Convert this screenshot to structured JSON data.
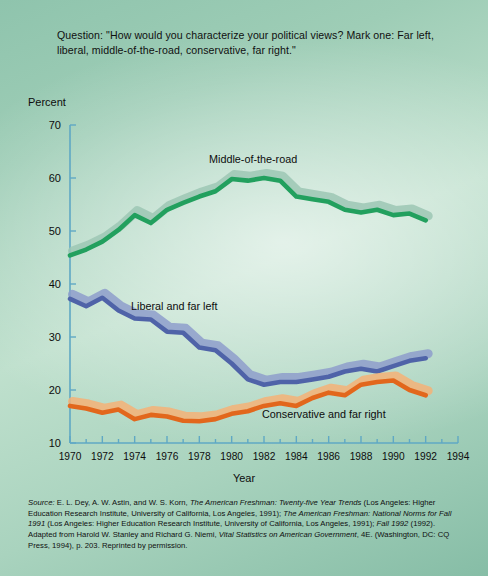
{
  "question": "Question: \"How would you characterize your political views? Mark one: Far left, liberal, middle-of-the-road, conservative, far right.\"",
  "axis": {
    "y_title": "Percent",
    "x_title": "Year"
  },
  "source_note": {
    "label": "Source:",
    "text_1": " E. L. Dey, A. W. Astin, and W. S. Korn, ",
    "italic_1": "The American Freshman: Twenty-five Year Trends",
    "text_2": " (Los Angeles: Higher Education Research Institute, University of California, Los Angeles, 1991); ",
    "italic_2": "The American Freshman: National Norms for Fall 1991",
    "text_3": " (Los Angeles: Higher Education Research Institute, University of California, Los Angeles, 1991); ",
    "italic_3": "Fall 1992",
    "text_4": " (1992). Adapted from Harold W. Stanley and Richard G. Niemi, ",
    "italic_4": "Vital Statistics on American Government",
    "text_5": ", 4E. (Washington, DC: CQ Press, 1994), p. 203. Reprinted by permission."
  },
  "colors": {
    "background_top": "#8fc4ad",
    "background_mid": "#bfe0cd",
    "axis": "#5fa8c4",
    "middle_of_road": "#22a05e",
    "middle_of_road_shadow": "#9cc7b4",
    "liberal": "#4f63a8",
    "liberal_shadow": "#8e9dcb",
    "conservative": "#e2671c",
    "conservative_shadow": "#f4b177"
  },
  "chart_data": {
    "type": "line",
    "title": "",
    "xlabel": "Year",
    "ylabel": "Percent",
    "xlim": [
      1970,
      1994
    ],
    "ylim": [
      10,
      70
    ],
    "grid": false,
    "legend_position": "inline-annotation",
    "ytick_labels": [
      10,
      20,
      30,
      40,
      50,
      60,
      70
    ],
    "xtick_labels": [
      1970,
      1972,
      1974,
      1976,
      1978,
      1980,
      1982,
      1984,
      1986,
      1988,
      1990,
      1992,
      1994
    ],
    "x": [
      1970,
      1971,
      1972,
      1973,
      1974,
      1975,
      1976,
      1977,
      1978,
      1979,
      1980,
      1981,
      1982,
      1983,
      1984,
      1985,
      1986,
      1987,
      1988,
      1989,
      1990,
      1991,
      1992
    ],
    "series": [
      {
        "name": "Middle-of-the-road",
        "color": "#22a05e",
        "values": [
          45.4,
          46.5,
          48.0,
          50.2,
          53.0,
          51.5,
          54.0,
          55.3,
          56.5,
          57.5,
          59.8,
          59.5,
          60.0,
          59.5,
          56.5,
          56.0,
          55.5,
          54.0,
          53.5,
          54.0,
          53.0,
          53.3,
          52.0
        ]
      },
      {
        "name": "Liberal and far left",
        "color": "#4f63a8",
        "values": [
          37.2,
          35.8,
          37.4,
          35.0,
          33.5,
          33.3,
          31.0,
          30.8,
          28.0,
          27.5,
          25.0,
          22.0,
          21.0,
          21.5,
          21.5,
          22.0,
          22.5,
          23.5,
          24.0,
          23.5,
          24.5,
          25.5,
          26.0
        ]
      },
      {
        "name": "Conservative and far right",
        "color": "#e2671c",
        "values": [
          17.0,
          16.5,
          15.7,
          16.3,
          14.5,
          15.3,
          15.0,
          14.2,
          14.1,
          14.5,
          15.5,
          16.0,
          17.0,
          17.5,
          17.0,
          18.5,
          19.5,
          19.0,
          21.0,
          21.5,
          21.8,
          20.0,
          19.0
        ]
      }
    ]
  }
}
